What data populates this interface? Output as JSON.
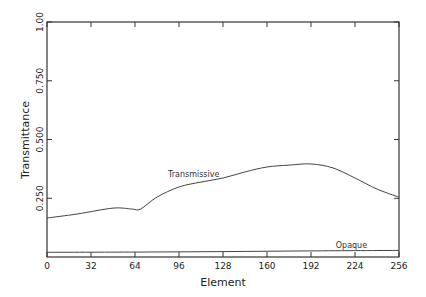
{
  "chart_data": {
    "type": "line",
    "title": "",
    "xlabel": "Element",
    "ylabel": "Transmittance",
    "xlim": [
      0,
      256
    ],
    "ylim": [
      0,
      1.0
    ],
    "x_ticks": [
      0,
      32,
      64,
      96,
      128,
      160,
      192,
      224,
      256
    ],
    "x_tick_labels": [
      "0",
      "32",
      "64",
      "96",
      "128",
      "160",
      "192",
      "224",
      "256"
    ],
    "y_ticks": [
      0.25,
      0.5,
      0.75,
      1.0
    ],
    "y_tick_labels": [
      "0.250",
      "0.500",
      "0.750",
      "1.00"
    ],
    "grid": false,
    "legend": "inline labels",
    "series": [
      {
        "name": "Transmissive",
        "x": [
          0,
          22,
          48,
          62,
          68,
          80,
          96,
          112,
          128,
          144,
          160,
          176,
          192,
          208,
          224,
          240,
          256
        ],
        "values": [
          0.166,
          0.183,
          0.208,
          0.204,
          0.204,
          0.255,
          0.298,
          0.319,
          0.336,
          0.362,
          0.383,
          0.391,
          0.396,
          0.379,
          0.336,
          0.289,
          0.255
        ]
      },
      {
        "name": "Opaque",
        "x": [
          0,
          64,
          128,
          192,
          256
        ],
        "values": [
          0.02,
          0.021,
          0.023,
          0.026,
          0.028
        ]
      }
    ],
    "annotations": [
      {
        "text": "Transmissive",
        "x": 88,
        "y": 0.34
      },
      {
        "text": "Opaque",
        "x": 210,
        "y": 0.04
      }
    ]
  }
}
